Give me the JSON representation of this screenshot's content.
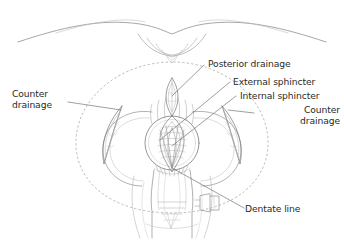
{
  "figure": {
    "background_color": "#ffffff",
    "line_color": "#6e6e6e",
    "text_color": "#2b2b2b",
    "dashed_color": "#a9a9a9"
  },
  "labels": {
    "posterior_drainage": "Posterior drainage",
    "external_sphincter": "External sphincter",
    "internal_sphincter": "Internal sphincter",
    "counter_drainage_right_line1": "Counter",
    "counter_drainage_right_line2": "drainage",
    "counter_drainage_left_line1": "Counter",
    "counter_drainage_left_line2": "drainage",
    "dentate_line": "Dentate line"
  },
  "anatomy": {
    "parts": [
      "buttock-cleft-outline",
      "perianal-dashed-oval",
      "left-buttock-arc",
      "right-buttock-arc",
      "anal-canal-circle",
      "internal-sphincter-lens",
      "posterior-drainage-incision",
      "left-counter-drainage-incision",
      "right-counter-drainage-incision",
      "lower-funnel",
      "accessory-rectangle"
    ]
  }
}
